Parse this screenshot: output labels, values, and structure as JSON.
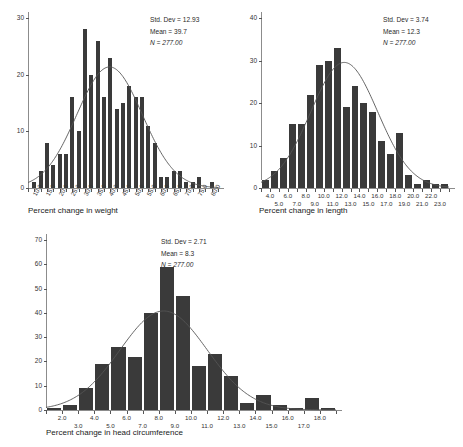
{
  "figure": {
    "background": "#ffffff",
    "bar_color": "#3a3a3a",
    "curve_color": "#555555",
    "axis_color": "#8c8c8c"
  },
  "chart_data": [
    {
      "id": "weight",
      "type": "bar",
      "title": "",
      "xlabel": "Percent change in weight",
      "ylabel": "",
      "ylim": [
        0,
        30
      ],
      "yticks": [
        0,
        10,
        20,
        30
      ],
      "ytick_labels": [
        "0",
        "10",
        "20",
        "30"
      ],
      "xlim": [
        7.5,
        82.5
      ],
      "xticks": [
        10.0,
        15.0,
        20.0,
        25.0,
        30.0,
        35.0,
        40.0,
        45.0,
        50.0,
        55.0,
        60.0,
        65.0,
        70.0,
        75.0,
        80.0
      ],
      "xtick_labels": [
        "10.0",
        "15.0",
        "20.0",
        "25.0",
        "30.0",
        "35.0",
        "40.0",
        "45.0",
        "50.0",
        "55.0",
        "60.0",
        "65.0",
        "70.0",
        "75.0",
        "80.0"
      ],
      "xtick_rotated": true,
      "xtick_stagger": false,
      "bin_width": 2.5,
      "bin_centers": [
        10.0,
        12.5,
        15.0,
        17.5,
        20.0,
        22.5,
        25.0,
        27.5,
        30.0,
        32.5,
        35.0,
        37.5,
        40.0,
        42.5,
        45.0,
        47.5,
        50.0,
        52.5,
        55.0,
        57.5,
        60.0,
        62.5,
        65.0,
        67.5,
        70.0,
        72.5,
        75.0,
        77.5,
        80.0
      ],
      "values": [
        1,
        3,
        8,
        4,
        6,
        6,
        16,
        10,
        28,
        20,
        26,
        16,
        23,
        14,
        15,
        18,
        16,
        16,
        11,
        8,
        2,
        2,
        3,
        3,
        1,
        1,
        2,
        0,
        1
      ],
      "annotations": {
        "std_dev_label": "Std. Dev = 12.93",
        "mean_label": "Mean = 39.7",
        "n_label": "N = 277.00",
        "std_dev": 12.93,
        "mean": 39.7,
        "n": 277.0
      },
      "normal_curve": true,
      "grid": false,
      "legend": "none"
    },
    {
      "id": "length",
      "type": "bar",
      "title": "",
      "xlabel": "Percent change in length",
      "ylabel": "",
      "ylim": [
        0,
        40
      ],
      "yticks": [
        0,
        10,
        20,
        30,
        40
      ],
      "ytick_labels": [
        "0",
        "10",
        "20",
        "30",
        "40"
      ],
      "xlim": [
        3.0,
        24.0
      ],
      "xticks": [
        4.0,
        5.0,
        6.0,
        7.0,
        8.0,
        9.0,
        10.0,
        11.0,
        12.0,
        13.0,
        14.0,
        15.0,
        16.0,
        17.0,
        18.0,
        19.0,
        20.0,
        21.0,
        22.0,
        23.0
      ],
      "xtick_labels": [
        "4.0",
        "5.0",
        "6.0",
        "7.0",
        "8.0",
        "9.0",
        "10.0",
        "11.0",
        "12.0",
        "13.0",
        "14.0",
        "15.0",
        "16.0",
        "17.0",
        "18.0",
        "19.0",
        "20.0",
        "21.0",
        "22.0",
        "23.0"
      ],
      "xtick_rotated": false,
      "xtick_stagger": true,
      "bin_width": 1.0,
      "bin_centers": [
        3.5,
        4.5,
        5.5,
        6.5,
        7.5,
        8.5,
        9.5,
        10.5,
        11.5,
        12.5,
        13.5,
        14.5,
        15.5,
        16.5,
        17.5,
        18.5,
        19.5,
        20.5,
        21.5,
        22.5,
        23.5
      ],
      "values": [
        2,
        4,
        7,
        15,
        15,
        22,
        29,
        30,
        33,
        19,
        24,
        20,
        18,
        11,
        8,
        13,
        3,
        1,
        2,
        1,
        1
      ],
      "annotations": {
        "std_dev_label": "Std. Dev = 3.74",
        "mean_label": "Mean = 12.3",
        "n_label": "N = 277.00",
        "std_dev": 3.74,
        "mean": 12.3,
        "n": 277.0
      },
      "normal_curve": true,
      "grid": false,
      "legend": "none"
    },
    {
      "id": "head",
      "type": "bar",
      "title": "",
      "xlabel": "Percent change in head circumference",
      "ylabel": "",
      "ylim": [
        0,
        70
      ],
      "yticks": [
        0,
        10,
        20,
        30,
        40,
        50,
        60,
        70
      ],
      "ytick_labels": [
        "0",
        "10",
        "20",
        "30",
        "40",
        "50",
        "60",
        "70"
      ],
      "xlim": [
        1.0,
        19.0
      ],
      "xticks": [
        2.0,
        3.0,
        4.0,
        5.0,
        6.0,
        7.0,
        8.0,
        9.0,
        10.0,
        11.0,
        12.0,
        13.0,
        14.0,
        15.0,
        16.0,
        17.0,
        18.0
      ],
      "xtick_labels": [
        "2.0",
        "3.0",
        "4.0",
        "5.0",
        "6.0",
        "7.0",
        "8.0",
        "9.0",
        "10.0",
        "11.0",
        "12.0",
        "13.0",
        "14.0",
        "15.0",
        "16.0",
        "17.0",
        "18.0"
      ],
      "xtick_rotated": false,
      "xtick_stagger": true,
      "bin_width": 1.0,
      "bin_centers": [
        1.5,
        2.5,
        3.5,
        4.5,
        5.5,
        6.5,
        7.5,
        8.5,
        9.5,
        10.5,
        11.5,
        12.5,
        13.5,
        14.5,
        15.5,
        16.5,
        17.5,
        18.5
      ],
      "values": [
        1,
        2,
        9,
        19,
        26,
        22,
        40,
        59,
        47,
        18,
        23,
        14,
        3,
        6,
        2,
        1,
        5,
        1
      ],
      "annotations": {
        "std_dev_label": "Std. Dev = 2.71",
        "mean_label": "Mean = 8.3",
        "n_label": "N = 277.00",
        "std_dev": 2.71,
        "mean": 8.3,
        "n": 277.0
      },
      "normal_curve": true,
      "grid": false,
      "legend": "none"
    }
  ]
}
